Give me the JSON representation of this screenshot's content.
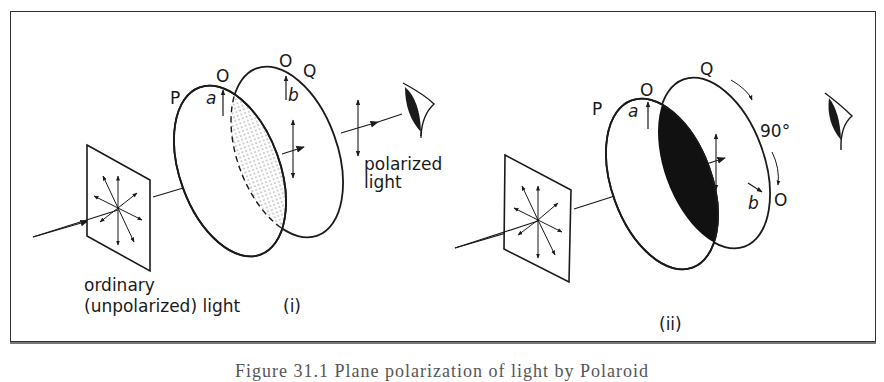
{
  "figure": {
    "caption": "Figure 31.1   Plane polarization of light by Polaroid",
    "panels": [
      {
        "id": "i",
        "tag": "(i)",
        "labels": {
          "polarizer": "P",
          "analyser": "Q",
          "axis_p": "O",
          "axis_q": "O",
          "arrow_a": "a",
          "arrow_b": "b",
          "source_line1": "ordinary",
          "source_line2": "(unpolarized) light",
          "output_line1": "polarized",
          "output_line2": "light"
        },
        "overlap_region": "dotted (light transmitted)"
      },
      {
        "id": "ii",
        "tag": "(ii)",
        "labels": {
          "polarizer": "P",
          "analyser": "Q",
          "axis_p": "O",
          "axis_q": "O",
          "arrow_a": "a",
          "arrow_b": "b",
          "rotation": "90°"
        },
        "overlap_region": "black (no light transmitted)"
      }
    ],
    "colors": {
      "ink": "#1a1a1a",
      "frame": "#333333",
      "background": "#ffffff"
    }
  }
}
